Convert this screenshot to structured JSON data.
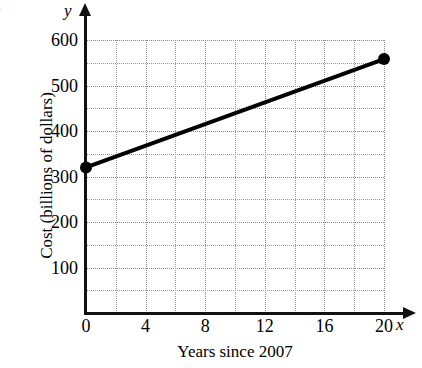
{
  "problem_label": ")",
  "axis_letters": {
    "x": "x",
    "y": "y"
  },
  "titles": {
    "x": "Years since 2007",
    "y": "Cost (billions of dollars)"
  },
  "chart_data": {
    "type": "line",
    "title": "",
    "subtitle": "",
    "xlabel": "Years since 2007",
    "ylabel": "Cost (billions of dollars)",
    "xlim": [
      0,
      20
    ],
    "ylim": [
      0,
      620
    ],
    "xticks": [
      0,
      4,
      8,
      12,
      16,
      20
    ],
    "xtick_labels": [
      "0",
      "4",
      "8",
      "12",
      "16",
      "20"
    ],
    "yticks": [
      100,
      200,
      300,
      400,
      500,
      600
    ],
    "ytick_labels": [
      "100",
      "200",
      "300",
      "400",
      "500",
      "600"
    ],
    "grid": true,
    "grid_style": "dotted",
    "grid_minor_x_step": 2,
    "grid_minor_y_step": 50,
    "legend": false,
    "legend_position": "none",
    "line_color": "#000000",
    "marker_color": "#000000",
    "series": [
      {
        "name": "Cost",
        "x": [
          0,
          20
        ],
        "y": [
          320,
          558
        ],
        "markers": [
          "circle",
          "circle"
        ]
      }
    ],
    "annotations": []
  }
}
